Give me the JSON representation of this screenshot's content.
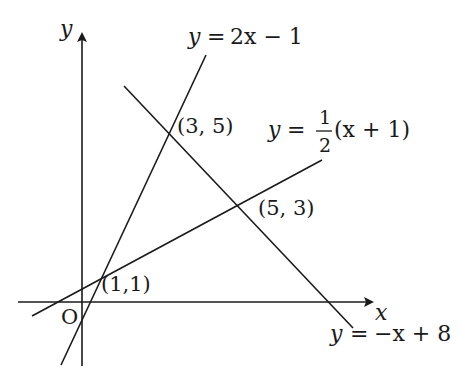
{
  "diagram": {
    "type": "coordinate-plane-lines",
    "axes": {
      "x_label": "x",
      "y_label": "y",
      "origin_label": "O",
      "origin_px": [
        82,
        302
      ],
      "x_axis_px": {
        "from": [
          18,
          302
        ],
        "to": [
          374,
          302
        ]
      },
      "y_axis_px": {
        "from": [
          82,
          365
        ],
        "to": [
          82,
          32
        ]
      }
    },
    "lines": [
      {
        "id": "line1",
        "equation_lhs": "y",
        "equation_eq": "=",
        "equation_rhs": "2x − 1",
        "px_from": [
          61,
          365
        ],
        "px_to": [
          206,
          55
        ]
      },
      {
        "id": "line2",
        "equation_lhs": "y",
        "equation_eq": "=",
        "frac_num": "1",
        "frac_den": "2",
        "equation_rhs": "(x + 1)",
        "px_from": [
          32,
          316
        ],
        "px_to": [
          322,
          160
        ]
      },
      {
        "id": "line3",
        "equation_lhs": "y",
        "equation_eq": "=",
        "equation_rhs": "−x + 8",
        "px_from": [
          124,
          86
        ],
        "px_to": [
          353,
          328
        ]
      }
    ],
    "intersections": [
      {
        "label": "(3, 5)",
        "px": [
          169,
          133
        ]
      },
      {
        "label": "(5, 3)",
        "px": [
          238,
          205
        ]
      },
      {
        "label": "(1,1)",
        "px": [
          101,
          278
        ]
      }
    ],
    "colors": {
      "ink": "#1a1a1a",
      "background": "#ffffff"
    }
  }
}
